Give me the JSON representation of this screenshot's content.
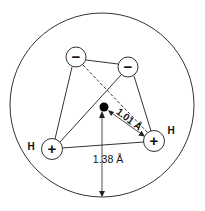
{
  "diagram": {
    "colors": {
      "stroke": "#333333",
      "fill": "#ffffff",
      "text": "#111111"
    },
    "outer_circle": {
      "cx": 102,
      "cy": 105,
      "r": 92
    },
    "nucleus": {
      "cx": 104,
      "cy": 107,
      "r": 4.5
    },
    "charges": [
      {
        "id": "neg1",
        "sign": "−",
        "cx": 76,
        "cy": 57,
        "r": 10
      },
      {
        "id": "neg2",
        "sign": "−",
        "cx": 128,
        "cy": 67,
        "r": 10
      },
      {
        "id": "pos_left",
        "sign": "+",
        "cx": 52,
        "cy": 149,
        "r": 10.5,
        "atom": "H"
      },
      {
        "id": "pos_right",
        "sign": "+",
        "cx": 154,
        "cy": 141,
        "r": 10.5,
        "atom": "H"
      }
    ],
    "labels": {
      "h_left": "H",
      "h_right": "H",
      "oh_distance": "1.01 Å",
      "radius": "1.38 Å"
    }
  }
}
